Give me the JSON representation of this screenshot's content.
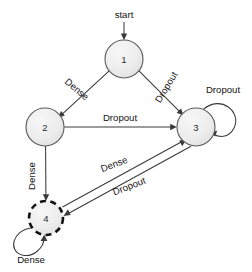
{
  "diagram": {
    "background_color": "#ffffff",
    "node_fill_color": "#ededed",
    "node_stroke_color": "#595959",
    "accept_node_stroke_color": "#111111",
    "edge_color": "#3a3a3a",
    "text_color": "#141414",
    "start": {
      "label": "start",
      "label_x": 124,
      "label_y": 14,
      "arrow_from_x": 124,
      "arrow_from_y": 22,
      "arrow_to_x": 124,
      "arrow_to_y": 39
    },
    "nodes": [
      {
        "id": "1",
        "label": "1",
        "cx": 124,
        "cy": 59,
        "r": 19,
        "shape": "circle",
        "style": "solid",
        "accepting": false
      },
      {
        "id": "2",
        "label": "2",
        "cx": 45,
        "cy": 127,
        "r": 19,
        "shape": "circle",
        "style": "solid",
        "accepting": false
      },
      {
        "id": "3",
        "label": "3",
        "cx": 196,
        "cy": 127,
        "r": 19,
        "shape": "circle",
        "style": "solid",
        "accepting": false
      },
      {
        "id": "4",
        "label": "4",
        "cx": 46,
        "cy": 218,
        "r": 17,
        "shape": "circle",
        "style": "dashed",
        "accepting": true
      }
    ],
    "edges": [
      {
        "id": "e1",
        "from": "1",
        "to": "2",
        "label": "Dense",
        "label_x": 77,
        "label_y": 89,
        "label_rotation": 40,
        "kind": "straight"
      },
      {
        "id": "e2",
        "from": "1",
        "to": "3",
        "label": "Dropout",
        "label_x": 166,
        "label_y": 87,
        "label_rotation": -59,
        "kind": "straight"
      },
      {
        "id": "e3",
        "from": "2",
        "to": "3",
        "label": "Dropout",
        "label_x": 120,
        "label_y": 117,
        "label_rotation": 0,
        "kind": "straight"
      },
      {
        "id": "e4",
        "from": "2",
        "to": "4",
        "label": "Dense",
        "label_x": 31,
        "label_y": 176,
        "label_rotation": -90,
        "kind": "straight"
      },
      {
        "id": "e5",
        "from": "4",
        "to": "3",
        "label": "Dense",
        "label_x": 114,
        "label_y": 164,
        "label_rotation": -21,
        "kind": "straight"
      },
      {
        "id": "e6",
        "from": "3",
        "to": "4",
        "label": "Dropout",
        "label_x": 129,
        "label_y": 186,
        "label_rotation": -21,
        "kind": "straight"
      },
      {
        "id": "e7",
        "from": "3",
        "to": "3",
        "label": "Dropout",
        "label_x": 223,
        "label_y": 89,
        "label_rotation": 0,
        "kind": "self-loop"
      },
      {
        "id": "e8",
        "from": "4",
        "to": "4",
        "label": "Dense",
        "label_x": 31,
        "label_y": 259,
        "label_rotation": 0,
        "kind": "self-loop"
      }
    ]
  }
}
